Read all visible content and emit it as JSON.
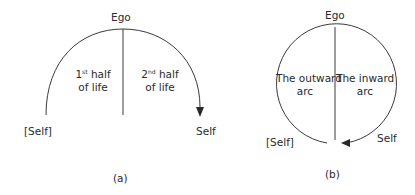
{
  "diagram_a": {
    "top_label": "Ego",
    "left_region": {
      "ordinal": "1",
      "ordinal_suffix": "st",
      "line1_rest": " half",
      "line2": "of life"
    },
    "right_region": {
      "ordinal": "2",
      "ordinal_suffix": "nd",
      "line1_rest": " half",
      "line2": "of life"
    },
    "left_end_label": "[Self]",
    "right_end_label": "Self",
    "caption": "(a)"
  },
  "diagram_b": {
    "top_label": "Ego",
    "left_region": {
      "line1": "The outward",
      "line2": "arc"
    },
    "right_region": {
      "line1": "The inward",
      "line2": "arc"
    },
    "left_end_label": "[Self]",
    "right_end_label": "Self",
    "caption": "(b)"
  },
  "colors": {
    "stroke": "#3a3a3a",
    "text": "#2a2a2a",
    "background": "#ffffff"
  }
}
